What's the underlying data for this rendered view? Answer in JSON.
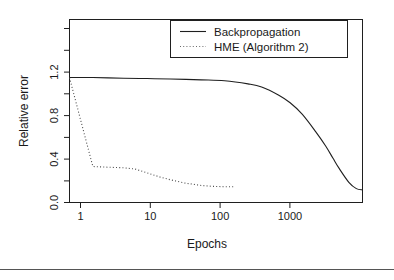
{
  "chart_data": {
    "type": "line",
    "title": "",
    "xlabel": "Epochs",
    "ylabel": "Relative error",
    "xscale": "log",
    "yscale": "linear",
    "xlim": [
      1,
      6000
    ],
    "ylim": [
      0.0,
      1.45
    ],
    "grid": false,
    "legend_position": "top-right",
    "xticks": [
      1,
      10,
      100,
      1000
    ],
    "xtick_labels": [
      "1",
      "10",
      "100",
      "1000"
    ],
    "yticks": [
      0.0,
      0.4,
      0.8,
      1.2
    ],
    "ytick_labels": [
      "0.0",
      "0.4",
      "0.8",
      "1.2"
    ],
    "yticks_minor": [
      0.2,
      0.6,
      1.0,
      1.4
    ],
    "series": [
      {
        "name": "Backpropagation",
        "style": "solid",
        "color": "#1f1f1f",
        "x": [
          1,
          2,
          5,
          10,
          20,
          50,
          100,
          200,
          300,
          500,
          700,
          1000,
          1500,
          2000,
          2500,
          3000,
          4000,
          5000,
          6000
        ],
        "values": [
          0.99,
          0.99,
          0.985,
          0.982,
          0.978,
          0.972,
          0.965,
          0.94,
          0.915,
          0.85,
          0.79,
          0.7,
          0.56,
          0.45,
          0.35,
          0.27,
          0.16,
          0.11,
          0.1
        ]
      },
      {
        "name": "HME (Algorithm 2)",
        "style": "dotted",
        "color": "#4a4a4a",
        "x": [
          1,
          2,
          3,
          5,
          7,
          10,
          15,
          20,
          30,
          50,
          70,
          100,
          130
        ],
        "values": [
          0.99,
          0.285,
          0.28,
          0.275,
          0.265,
          0.235,
          0.2,
          0.18,
          0.155,
          0.135,
          0.128,
          0.125,
          0.125
        ]
      }
    ],
    "legend_entries": [
      {
        "label": "Backpropagation",
        "style": "solid"
      },
      {
        "label": "HME (Algorithm 2)",
        "style": "dotted"
      }
    ]
  },
  "figure": {
    "background_color": "#ffffff",
    "axis_color": "#1f1f1f"
  }
}
